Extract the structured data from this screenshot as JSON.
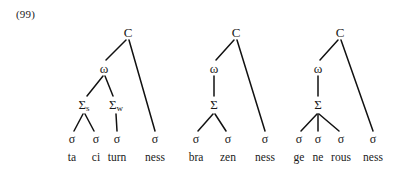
{
  "example": {
    "number": "(99)"
  },
  "colors": {
    "ink": "#1a1a1a",
    "background": "#ffffff",
    "line": "#111111"
  },
  "glyphs": {
    "c": "C",
    "omega": "ω",
    "sigma_capital": "Σ",
    "sigma_small": "σ",
    "sub_strong": "s",
    "sub_weak": "w"
  },
  "trees": [
    {
      "id": "tree-tacitumness",
      "word": "tacitumness",
      "root": {
        "label": "C",
        "x": 128,
        "y": 32
      },
      "omega": {
        "label": "ω",
        "x": 104,
        "y": 68
      },
      "feet": [
        {
          "label": "Σ",
          "subscript": "s",
          "x": 84,
          "y": 104,
          "branching": "binary"
        },
        {
          "label": "Σ",
          "subscript": "w",
          "x": 116,
          "y": 104,
          "branching": "unary"
        }
      ],
      "syllables": [
        {
          "symbol": "σ",
          "text": "ta",
          "x": 72,
          "y": 139
        },
        {
          "symbol": "σ",
          "text": "ci",
          "x": 96,
          "y": 139
        },
        {
          "symbol": "σ",
          "text": "turn",
          "x": 117,
          "y": 139
        },
        {
          "symbol": "σ",
          "text": "ness",
          "x": 155,
          "y": 139
        }
      ]
    },
    {
      "id": "tree-brazenness",
      "word": "brazenness",
      "root": {
        "label": "C",
        "x": 236,
        "y": 32
      },
      "omega": {
        "label": "ω",
        "x": 214,
        "y": 68
      },
      "feet": [
        {
          "label": "Σ",
          "subscript": "",
          "x": 214,
          "y": 104,
          "branching": "binary"
        }
      ],
      "syllables": [
        {
          "symbol": "σ",
          "text": "bra",
          "x": 196,
          "y": 139
        },
        {
          "symbol": "σ",
          "text": "zen",
          "x": 228,
          "y": 139
        },
        {
          "symbol": "σ",
          "text": "ness",
          "x": 265,
          "y": 139
        }
      ]
    },
    {
      "id": "tree-generousness",
      "word": "generousness",
      "root": {
        "label": "C",
        "x": 340,
        "y": 32
      },
      "omega": {
        "label": "ω",
        "x": 318,
        "y": 68
      },
      "feet": [
        {
          "label": "Σ",
          "subscript": "",
          "x": 318,
          "y": 104,
          "branching": "ternary"
        }
      ],
      "syllables": [
        {
          "symbol": "σ",
          "text": "ge",
          "x": 299,
          "y": 139
        },
        {
          "symbol": "σ",
          "text": "ne",
          "x": 318,
          "y": 139
        },
        {
          "symbol": "σ",
          "text": "rous",
          "x": 341,
          "y": 139
        },
        {
          "symbol": "σ",
          "text": "ness",
          "x": 373,
          "y": 139
        }
      ]
    }
  ],
  "word_baseline_y": 152
}
